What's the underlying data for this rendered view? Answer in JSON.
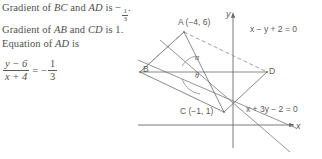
{
  "solution": {
    "line1": {
      "prefix": "Gradient of ",
      "seg1": "BC",
      "mid": " and ",
      "seg2": "AD",
      "suffix": " is ",
      "value_sign": "−",
      "value_num": "1",
      "value_den": "3",
      "period": "."
    },
    "line2": {
      "prefix": "Gradient of ",
      "seg1": "AB",
      "mid": " and ",
      "seg2": "CD",
      "suffix": " is 1."
    },
    "line3": {
      "prefix": "Equation of ",
      "seg1": "AD",
      "suffix": " is"
    },
    "equation": {
      "lhs_num": "y − 6",
      "lhs_den": "x + 4",
      "equals": "=",
      "rhs_sign": "−",
      "rhs_num": "1",
      "rhs_den": "3"
    }
  },
  "diagram": {
    "axis_x_label": "x",
    "axis_y_label": "y",
    "points": {
      "A": "A (−4, 6)",
      "B": "B",
      "C": "C (−1, 1)",
      "D": "D"
    },
    "angles": {
      "alpha": "α",
      "theta": "θ"
    },
    "line_equations": {
      "line_ad": "x − y + 2 = 0",
      "line_bc": "x + 3y − 2 = 0"
    },
    "colors": {
      "stroke": "#6b6b6b",
      "text": "#5a5a5a"
    }
  }
}
